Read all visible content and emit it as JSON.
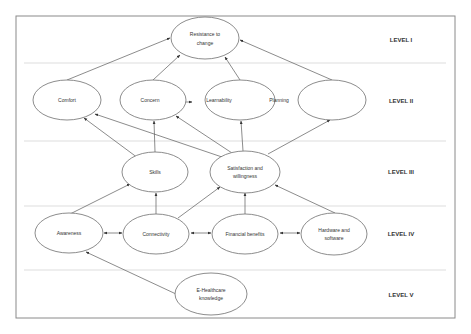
{
  "diagram": {
    "type": "hierarchical-model",
    "levels": [
      {
        "id": "L1",
        "label": "LEVEL I"
      },
      {
        "id": "L2",
        "label": "LEVEL II"
      },
      {
        "id": "L3",
        "label": "LEVEL III"
      },
      {
        "id": "L4",
        "label": "LEVEL IV"
      },
      {
        "id": "L5",
        "label": "LEVEL V"
      }
    ],
    "nodes": {
      "resistance": {
        "line1": "Resistance to",
        "line2": "change",
        "level": "L1"
      },
      "comfort": {
        "label": "Comfort",
        "level": "L2"
      },
      "concern": {
        "label": "Concern",
        "level": "L2"
      },
      "learnability": {
        "label": "Learnability",
        "level": "L2"
      },
      "planning": {
        "label": "Planning",
        "level": "L2"
      },
      "empty": {
        "label": "",
        "level": "L2"
      },
      "skills": {
        "label": "Skills",
        "level": "L3"
      },
      "satisfaction": {
        "line1": "Satisfaction and",
        "line2": "willingness",
        "level": "L3"
      },
      "awareness": {
        "label": "Awareness",
        "level": "L4"
      },
      "connectivity": {
        "label": "Connectivity",
        "level": "L4"
      },
      "financial": {
        "label": "Financial benefits",
        "level": "L4"
      },
      "hardware": {
        "line1": "Hardware and",
        "line2": "software",
        "level": "L4"
      },
      "ehealth": {
        "line1": "E-Healthcare",
        "line2": "knowledge",
        "level": "L5"
      }
    },
    "edges": [
      {
        "from": "comfort",
        "to": "resistance",
        "type": "directed"
      },
      {
        "from": "concern",
        "to": "resistance",
        "type": "directed"
      },
      {
        "from": "learnability",
        "to": "resistance",
        "type": "directed"
      },
      {
        "from": "empty",
        "to": "resistance",
        "type": "directed"
      },
      {
        "from": "concern",
        "to": "learnability",
        "type": "bidirectional"
      },
      {
        "from": "learnability",
        "to": "planning",
        "type": "bidirectional"
      },
      {
        "from": "skills",
        "to": "comfort",
        "type": "directed"
      },
      {
        "from": "skills",
        "to": "concern",
        "type": "directed"
      },
      {
        "from": "satisfaction",
        "to": "comfort",
        "type": "directed"
      },
      {
        "from": "satisfaction",
        "to": "concern",
        "type": "directed"
      },
      {
        "from": "satisfaction",
        "to": "learnability",
        "type": "directed"
      },
      {
        "from": "satisfaction",
        "to": "empty",
        "type": "directed"
      },
      {
        "from": "awareness",
        "to": "skills",
        "type": "directed"
      },
      {
        "from": "connectivity",
        "to": "skills",
        "type": "directed"
      },
      {
        "from": "connectivity",
        "to": "satisfaction",
        "type": "directed"
      },
      {
        "from": "financial",
        "to": "satisfaction",
        "type": "directed"
      },
      {
        "from": "hardware",
        "to": "satisfaction",
        "type": "directed"
      },
      {
        "from": "awareness",
        "to": "connectivity",
        "type": "bidirectional"
      },
      {
        "from": "connectivity",
        "to": "financial",
        "type": "bidirectional"
      },
      {
        "from": "financial",
        "to": "hardware",
        "type": "bidirectional"
      },
      {
        "from": "ehealth",
        "to": "awareness",
        "type": "directed"
      }
    ]
  },
  "colors": {
    "line": "#5a5a5a",
    "ellipse_stroke": "#6e6e6e",
    "divider": "#d4d4d4",
    "frame": "#8a8a8a",
    "text": "#333333"
  }
}
